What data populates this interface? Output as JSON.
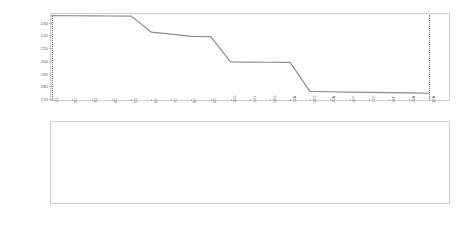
{
  "chart_data": [
    {
      "type": "line",
      "title": "",
      "xlabel": "",
      "ylabel": "",
      "ylim": [
        170,
        236
      ],
      "yticks": [
        230,
        220,
        210,
        200,
        190,
        180,
        170
      ],
      "ytick_labels": [
        "230",
        "220",
        "210",
        "200",
        "190",
        "180",
        "170"
      ],
      "grid": false,
      "legend": "none",
      "categories": [
        "1G",
        "2C",
        "3G",
        "4C",
        "5G",
        "6C",
        "7C",
        "8C",
        "9C",
        "10G",
        "11G",
        "12G",
        "13A",
        "14G",
        "15A",
        "16Y",
        "17Y",
        "18T",
        "19A",
        "20A"
      ],
      "x": [
        1,
        2,
        3,
        4,
        5,
        6,
        7,
        8,
        9,
        10,
        11,
        12,
        13,
        14,
        15,
        16,
        17,
        18,
        19,
        20
      ],
      "values": [
        235.5,
        235.4,
        235.3,
        235.2,
        235.1,
        222.5,
        221.0,
        219.2,
        219.0,
        199.2,
        199.0,
        198.9,
        198.8,
        176.0,
        175.7,
        175.4,
        175.2,
        175.0,
        174.8,
        174.5
      ],
      "vlines": [
        1,
        20
      ],
      "vline_style": "dotted"
    },
    {
      "type": "line",
      "title": "",
      "xlabel": "",
      "ylabel": "",
      "ylim": [
        1913,
        2062
      ],
      "yticks": [
        2050,
        2025,
        2000,
        1975,
        1950,
        1925
      ],
      "ytick_labels": [
        "2050",
        "2025",
        "2000",
        "1975",
        "1950",
        "1925"
      ],
      "grid": false,
      "legend": "none",
      "categories": [
        "347C",
        "348A",
        "349A",
        "350T",
        "351G",
        "352G",
        "353G",
        "354A",
        "355A",
        "356G",
        "357G",
        "358G",
        "359C",
        "360C",
        "361G",
        "362G",
        "363A",
        "364A",
        "365G",
        "366C",
        "367G",
        "368G",
        "370C",
        "371G",
        "372G",
        "373C",
        "374G",
        "375C",
        "376G",
        "377G",
        "378G",
        "379A",
        "380G",
        "381A",
        "382T",
        "383T",
        "384T",
        "385A",
        "386A",
        "387G",
        "388G",
        "389C",
        "390C",
        "391T",
        "392G",
        "393C",
        "394T",
        "395G",
        "396A",
        "397T",
        "398G",
        "399T",
        "400A",
        "401A",
        "402G",
        "403G",
        "404G",
        "405G",
        "406T"
      ],
      "x": [
        1,
        2,
        3,
        4,
        5,
        6,
        7,
        8,
        9,
        10,
        11,
        12,
        13,
        14,
        15,
        16,
        17,
        18,
        19,
        20,
        21,
        22,
        23,
        24,
        25,
        26,
        27,
        28,
        29,
        30,
        31,
        32,
        33,
        34,
        35,
        36,
        37,
        38,
        39,
        40,
        41,
        42,
        43,
        44,
        45,
        46,
        47,
        48,
        49,
        50,
        51,
        52,
        53,
        54,
        55,
        56,
        57,
        58,
        59
      ],
      "values": [
        2056,
        2056,
        2054,
        2053,
        2052,
        2052,
        2040,
        2039,
        2038,
        2037,
        2036,
        2035,
        2033,
        1998,
        1997,
        1996,
        1995,
        1995,
        1981,
        1980,
        1979,
        1979,
        1979,
        1978,
        1978,
        1978,
        1978,
        1978,
        1977,
        1977,
        1976,
        1975,
        1974,
        1972,
        1970,
        1969,
        1968,
        1967,
        1966,
        1966,
        1943,
        1925,
        1924,
        1924,
        1923,
        1923,
        1922,
        1922,
        1922,
        1922,
        1921,
        1921,
        1918,
        1917,
        1917,
        1917,
        1916,
        1916,
        1916
      ],
      "vlines": [
        20,
        42
      ],
      "vline_style": "dotted"
    }
  ]
}
